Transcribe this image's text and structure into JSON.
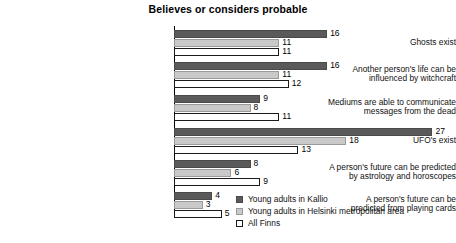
{
  "chart_data": {
    "type": "bar",
    "orientation": "horizontal",
    "title": "Believes or considers probable",
    "xlabel": "",
    "ylabel": "",
    "xlim": [
      0,
      28
    ],
    "grid": false,
    "legend_position": "bottom-right",
    "categories": [
      "Ghosts exist",
      "Another person's life can be influenced by witchcraft",
      "Mediums are able to communicate messages from the dead",
      "UFO's exist",
      "A person's future can be predicted by astrology and horoscopes",
      "A person's future can be predicted from playing cards"
    ],
    "category_lines": [
      [
        "Ghosts exist"
      ],
      [
        "Another person's life can be",
        "influenced by witchcraft"
      ],
      [
        "Mediums are able to communicate",
        "messages from the dead"
      ],
      [
        "UFO's exist"
      ],
      [
        "A person's future can be predicted",
        "by astrology and horoscopes"
      ],
      [
        "A person's future can be",
        "predicted from playing cards"
      ]
    ],
    "series": [
      {
        "name": "Young adults in Kallio",
        "color": "#5a5a5a",
        "values": [
          16,
          16,
          9,
          27,
          8,
          4
        ]
      },
      {
        "name": "Young adults in Helsinki metropolitan area",
        "color": "#c9c9c9",
        "values": [
          11,
          11,
          8,
          18,
          6,
          3
        ]
      },
      {
        "name": "All Finns",
        "color": "#ffffff",
        "values": [
          11,
          12,
          11,
          13,
          9,
          5
        ]
      }
    ]
  },
  "legend": {
    "items": [
      {
        "label": "Young adults in Kallio"
      },
      {
        "label": "Young adults in Helsinki metropolitan area"
      },
      {
        "label": "All Finns"
      }
    ]
  }
}
